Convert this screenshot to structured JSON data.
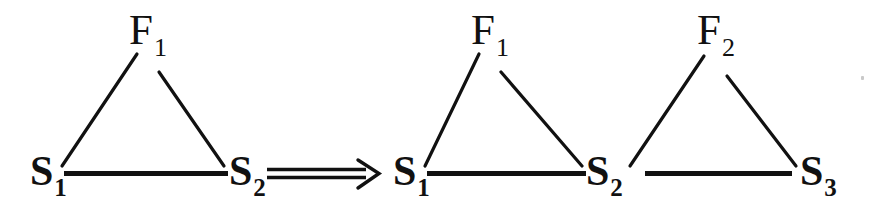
{
  "figure": {
    "kind": "graph-rewrite-rule",
    "background_color": "#ffffff",
    "ink_color": "#111111",
    "left_graph": {
      "name": "left-hand-side",
      "nodes": [
        {
          "id": "L-F1",
          "label": "F",
          "subscript": "1",
          "x": 147,
          "y": 30
        },
        {
          "id": "L-S1",
          "label": "S",
          "subscript": "1",
          "x": 46,
          "y": 172
        },
        {
          "id": "L-S2",
          "label": "S",
          "subscript": "2",
          "x": 245,
          "y": 172
        }
      ],
      "edges": [
        {
          "from": "L-S1",
          "to": "L-F1"
        },
        {
          "from": "L-F1",
          "to": "L-S2"
        },
        {
          "from": "L-S1",
          "to": "L-S2"
        }
      ]
    },
    "arrow": {
      "name": "rewrite-arrow",
      "glyph": "==>",
      "style": "double-line-with-open-arrowhead",
      "x_start": 267,
      "x_end": 379,
      "y": 174
    },
    "right_graph": {
      "name": "right-hand-side",
      "nodes": [
        {
          "id": "R-F1",
          "label": "F",
          "subscript": "1",
          "x": 489,
          "y": 30
        },
        {
          "id": "R-F2",
          "label": "F",
          "subscript": "2",
          "x": 714,
          "y": 30
        },
        {
          "id": "R-S1",
          "label": "S",
          "subscript": "1",
          "x": 409,
          "y": 172
        },
        {
          "id": "R-S2",
          "label": "S",
          "subscript": "2",
          "x": 602,
          "y": 172
        },
        {
          "id": "R-S3",
          "label": "S",
          "subscript": "3",
          "x": 816,
          "y": 172
        }
      ],
      "edges": [
        {
          "from": "R-S1",
          "to": "R-F1"
        },
        {
          "from": "R-F1",
          "to": "R-S2"
        },
        {
          "from": "R-S1",
          "to": "R-S2"
        },
        {
          "from": "R-S2",
          "to": "R-F2"
        },
        {
          "from": "R-F2",
          "to": "R-S3"
        },
        {
          "from": "R-S2",
          "to": "R-S3"
        }
      ]
    },
    "artifact": {
      "name": "scan-speck",
      "x": 862,
      "y": 77
    }
  }
}
